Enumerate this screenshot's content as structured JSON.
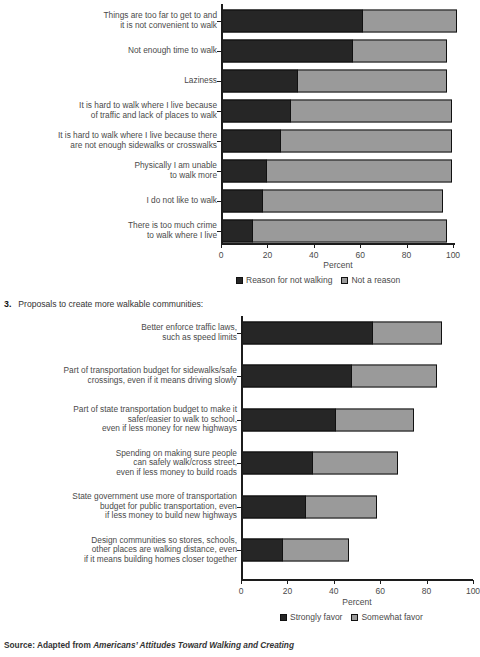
{
  "section": {
    "number": "3.",
    "title": "Proposals to create more walkable communities:"
  },
  "source": {
    "prefix": "Source: Adapted from ",
    "italic": "Americans’ Attitudes Toward Walking and Creating"
  },
  "colors": {
    "dark": "#262626",
    "light": "#9a9a9a",
    "axis": "#1c1c1c",
    "text": "#4a4a4a",
    "background": "#ffffff"
  },
  "chart_data": [
    {
      "id": "reasons-for-not-walking",
      "type": "bar",
      "orientation": "horizontal",
      "stacked": true,
      "title": "",
      "xlabel": "Percent",
      "ylabel": "",
      "xlim": [
        0,
        100
      ],
      "xticks": [
        0,
        20,
        40,
        60,
        80,
        100
      ],
      "grid": false,
      "legend_position": "bottom",
      "categories": [
        "Things are too far to get to and\nit is not convenient to walk",
        "Not enough time to walk",
        "Laziness",
        "It is hard to walk where I live because\nof traffic and lack of places to walk",
        "It is hard to walk where I live because there\nare not enough sidewalks or crosswalks",
        "Physically I am unable\nto walk more",
        "I do not like to walk",
        "There is too much crime\nto walk where I live"
      ],
      "series": [
        {
          "name": "Reason for not walking",
          "color": "#262626",
          "values": [
            61,
            57,
            33,
            30,
            26,
            20,
            18,
            14
          ]
        },
        {
          "name": "Not a reason",
          "color": "#9a9a9a",
          "values": [
            41,
            41,
            65,
            70,
            74,
            80,
            78,
            84
          ]
        }
      ],
      "totals": [
        102,
        98,
        98,
        100,
        100,
        100,
        96,
        98
      ]
    },
    {
      "id": "proposals-walkable-communities",
      "type": "bar",
      "orientation": "horizontal",
      "stacked": true,
      "title": "Proposals to create more walkable communities:",
      "xlabel": "Percent",
      "ylabel": "",
      "xlim": [
        0,
        100
      ],
      "xticks": [
        0,
        20,
        40,
        60,
        80,
        100
      ],
      "grid": false,
      "legend_position": "bottom",
      "categories": [
        "Better enforce traffic laws,\nsuch as speed limits",
        "Part of transportation budget for sidewalks/safe\ncrossings, even if it means driving slowly",
        "Part of state transportation budget to make it\nsafer/easier to walk to school,\neven if less money for new highways",
        "Spending on making sure people\ncan safely walk/cross street,\neven if less money to build roads",
        "State government use more of transportation\nbudget for public transportation, even\nif less money to build new highways",
        "Design communities so stores, schools,\nother places are walking distance, even\nif it means building homes closer together"
      ],
      "series": [
        {
          "name": "Strongly favor",
          "color": "#262626",
          "values": [
            57,
            48,
            41,
            31,
            28,
            18
          ]
        },
        {
          "name": "Somewhat favor",
          "color": "#9a9a9a",
          "values": [
            30,
            37,
            34,
            37,
            31,
            29
          ]
        }
      ],
      "totals": [
        87,
        85,
        75,
        68,
        59,
        47
      ]
    }
  ]
}
